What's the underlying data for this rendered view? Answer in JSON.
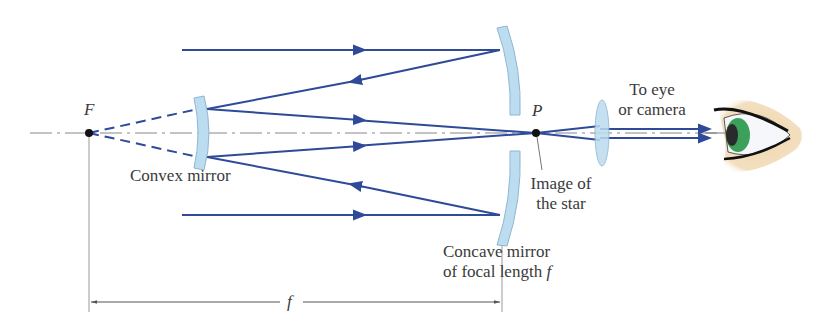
{
  "figure": {
    "type": "Cassegrain reflecting telescope ray diagram",
    "colors": {
      "ray": "#2e4a99",
      "mirror_fill": "#bcdcef",
      "mirror_edge": "#8fb6d2",
      "axis": "#777777",
      "text": "#3a3a3a",
      "iris": "#3aa05a",
      "skin": "#efd9b5"
    }
  },
  "labels": {
    "focal_point": "F",
    "image_point": "P",
    "convex_mirror": "Convex mirror",
    "image_of_star_line1": "Image of",
    "image_of_star_line2": "the star",
    "concave_mirror_line1": "Concave mirror",
    "concave_mirror_line2_prefix": "of focal length ",
    "concave_mirror_line2_var": "f",
    "to_eye_line1": "To eye",
    "to_eye_line2": "or camera",
    "dimension": "f"
  }
}
